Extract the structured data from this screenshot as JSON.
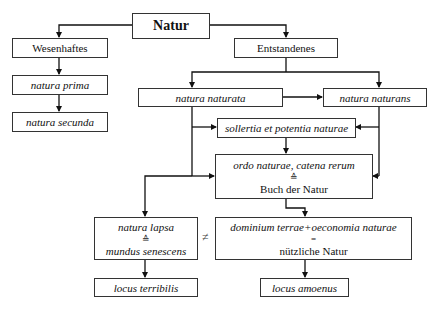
{
  "diagram": {
    "root": {
      "label": "Natur"
    },
    "left_branch": {
      "header": "Wesenhaftes",
      "items": [
        "natura prima",
        "natura secunda"
      ]
    },
    "right_branch": {
      "header": "Entstandenes",
      "naturata": "natura naturata",
      "naturans": "natura naturans",
      "sollertia": "sollertia et potentia naturae",
      "ordo": {
        "line1": "ordo naturae, catena rerum",
        "symbol": "≙",
        "line2": "Buch der Natur"
      },
      "lapsa": {
        "line1": "natura lapsa",
        "symbol": "≙",
        "line2": "mundus senescens"
      },
      "dominium": {
        "line1": "dominium terrae+oeconomia naturae",
        "symbol": "=",
        "line2": "nützliche Natur"
      },
      "terribilis": "locus terribilis",
      "amoenus": "locus amoenus"
    },
    "not_equal_symbol": "≠"
  }
}
